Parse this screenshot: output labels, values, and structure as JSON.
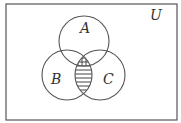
{
  "diagram": {
    "type": "venn",
    "universe_label": "U",
    "sets": [
      {
        "label": "A",
        "cx": 84,
        "cy": 41,
        "r": 25
      },
      {
        "label": "B",
        "cx": 67,
        "cy": 75,
        "r": 25
      },
      {
        "label": "C",
        "cx": 100,
        "cy": 75,
        "r": 25
      }
    ],
    "shaded_regions": [
      {
        "region": "A∩B∩C",
        "pattern": "grid"
      },
      {
        "region": "(B∩C)∖A",
        "pattern": "horizontal-lines"
      }
    ],
    "colors": {
      "stroke": "#555555",
      "background": "#ffffff"
    }
  }
}
